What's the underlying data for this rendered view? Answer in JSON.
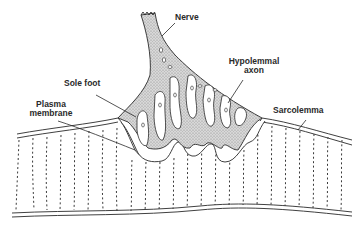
{
  "diagram": {
    "labels": {
      "nerve": "Nerve",
      "hypolemmal_axon_line1": "Hypolemmal",
      "hypolemmal_axon_line2": "axon",
      "sole_foot": "Sole foot",
      "plasma_membrane_line1": "Plasma",
      "plasma_membrane_line2": "membrane",
      "sarcolemma": "Sarcolemma"
    },
    "colors": {
      "line": "#2a2a2a",
      "stipple_fill": "#c9c9c9",
      "background": "#ffffff"
    }
  }
}
